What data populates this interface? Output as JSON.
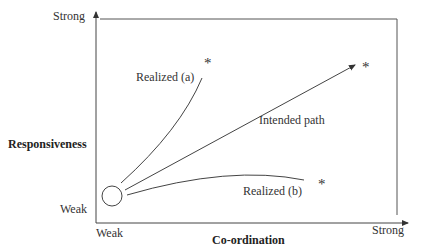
{
  "diagram": {
    "y_axis": {
      "label": "Responsiveness",
      "top_label": "Strong",
      "bottom_label": "Weak"
    },
    "x_axis": {
      "label": "Co-ordination",
      "left_label": "Weak",
      "right_label": "Strong"
    },
    "paths": [
      {
        "name": "Realized (a)",
        "end_marker": "*"
      },
      {
        "name": "Intended path",
        "end_marker": "*"
      },
      {
        "name": "Realized (b)",
        "end_marker": "*"
      }
    ],
    "origin_marker": "circle",
    "colors": {
      "line": "#3a3a3a",
      "background": "#ffffff"
    }
  }
}
